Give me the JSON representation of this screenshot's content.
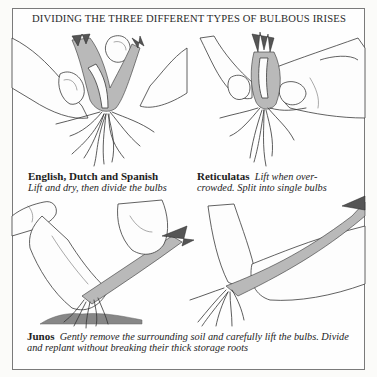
{
  "title": "DIVIDING THE THREE DIFFERENT TYPES OF BULBOUS IRISES",
  "panels": [
    {
      "id": "english-dutch-spanish",
      "heading": "English, Dutch and Spanish",
      "text_line1": "Lift and dry, then divide the bulbs",
      "illustration": "hands-pulling-apart-bulb-cluster"
    },
    {
      "id": "reticulatas",
      "heading": "Reticulatas",
      "text_line1": "Lift when over-",
      "text_line2": "crowded. Split into single bulbs",
      "illustration": "hand-splitting-single-bulbs"
    },
    {
      "id": "junos",
      "heading": "Junos",
      "text_line1": "Gently remove the surrounding soil and carefully lift the bulbs. Divide",
      "text_line2": "and replant without breaking their thick storage roots",
      "illustration": [
        "trowel-lifting-juno-bulbs",
        "hands-dividing-juno-bulbs"
      ]
    }
  ],
  "colors": {
    "ink": "#1d1d1d",
    "paper": "#fefefe",
    "border": "#7a7a7a"
  }
}
